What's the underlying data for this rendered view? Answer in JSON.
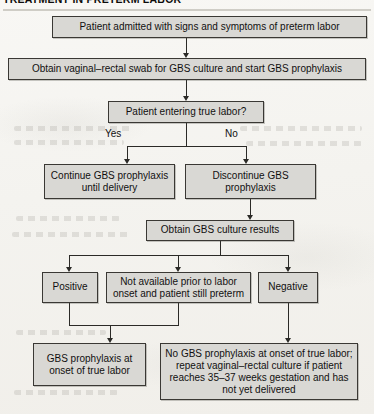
{
  "title": "TREATMENT IN PRETERM LABOR",
  "colors": {
    "page_background": "#f6f5f2",
    "box_fill": "#d9d8d4",
    "box_border": "#3a3834",
    "connector": "#2b2a27",
    "text": "#111010"
  },
  "nodes": {
    "admission": "Patient admitted with signs and symptoms of preterm labor",
    "swab": "Obtain vaginal–rectal swab for GBS culture and start GBS prophylaxis",
    "decision": "Patient entering true labor?",
    "continue_prophylaxis": "Continue GBS prophylaxis until delivery",
    "discontinue_prophylaxis": "Discontinue GBS prophylaxis",
    "culture_results": "Obtain GBS culture results",
    "positive": "Positive",
    "not_available": "Not available prior to labor onset and patient still preterm",
    "negative": "Negative",
    "gbs_at_onset": "GBS prophylaxis at onset of true labor",
    "no_gbs_at_onset": "No GBS prophylaxis at onset of true labor; repeat vaginal–rectal culture if patient reaches 35–37 weeks gestation and has not yet delivered"
  },
  "branch_labels": {
    "yes": "Yes",
    "no": "No"
  }
}
